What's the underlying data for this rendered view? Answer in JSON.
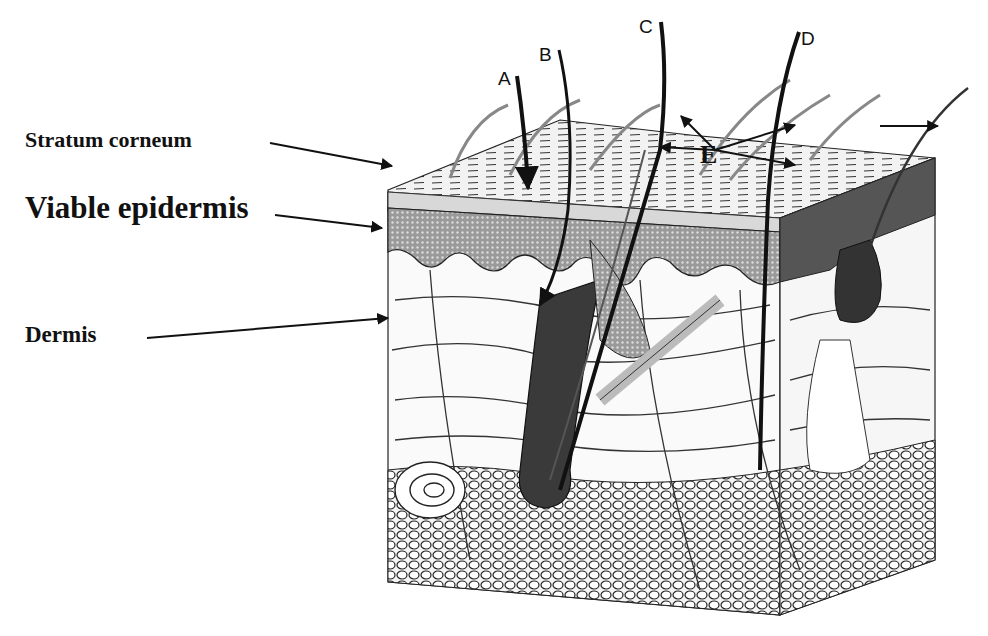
{
  "figure": {
    "layer_labels": [
      {
        "id": "stratum-corneum",
        "text": "Stratum corneum"
      },
      {
        "id": "viable-epidermis",
        "text": "Viable epidermis"
      },
      {
        "id": "dermis",
        "text": "Dermis"
      }
    ],
    "route_labels": [
      {
        "id": "route-a",
        "text": "A"
      },
      {
        "id": "route-b",
        "text": "B"
      },
      {
        "id": "route-c",
        "text": "C"
      },
      {
        "id": "route-d",
        "text": "D"
      },
      {
        "id": "route-e",
        "text": "E"
      }
    ],
    "colors": {
      "ink": "#111111",
      "background": "#ffffff",
      "epidermis_shade": "#5a5a5a",
      "corneum_shade": "#e8e8e8",
      "fat_shade": "#cfcfcf"
    }
  }
}
